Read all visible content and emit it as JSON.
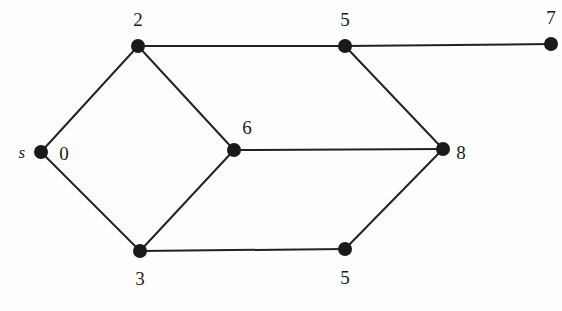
{
  "figure": {
    "type": "undirected-graph-diagram",
    "background_color": "#fefefe",
    "ink_color": "#1a1a1a",
    "edge_color": "#222222",
    "width": 562,
    "height": 311
  },
  "graph_data": {
    "type": "node-link-diagram",
    "directed": false,
    "node_radius": 7,
    "edge_width": 2,
    "nodes": [
      {
        "id": "s",
        "label": "s",
        "label_style": "italic",
        "x": 41,
        "y": 152,
        "label_x": 22,
        "label_y": 152,
        "extra_label": "0",
        "extra_label_x": 64,
        "extra_label_y": 153
      },
      {
        "id": "n2",
        "label": "2",
        "label_style": "normal",
        "x": 138,
        "y": 46,
        "label_x": 138,
        "label_y": 19
      },
      {
        "id": "n3",
        "label": "3",
        "label_style": "normal",
        "x": 140,
        "y": 251,
        "label_x": 140,
        "label_y": 278
      },
      {
        "id": "n6",
        "label": "6",
        "label_style": "normal",
        "x": 234,
        "y": 150,
        "label_x": 247,
        "label_y": 127
      },
      {
        "id": "n5t",
        "label": "5",
        "label_style": "normal",
        "x": 345,
        "y": 46,
        "label_x": 345,
        "label_y": 19
      },
      {
        "id": "n5b",
        "label": "5",
        "label_style": "normal",
        "x": 345,
        "y": 249,
        "label_x": 345,
        "label_y": 277
      },
      {
        "id": "n8",
        "label": "8",
        "label_style": "normal",
        "x": 443,
        "y": 149,
        "label_x": 461,
        "label_y": 152
      },
      {
        "id": "n7",
        "label": "7",
        "label_style": "normal",
        "x": 551,
        "y": 44,
        "label_x": 551,
        "label_y": 17
      }
    ],
    "edges": [
      {
        "from": "s",
        "to": "n2"
      },
      {
        "from": "s",
        "to": "n3"
      },
      {
        "from": "n2",
        "to": "n6"
      },
      {
        "from": "n3",
        "to": "n6"
      },
      {
        "from": "n2",
        "to": "n5t"
      },
      {
        "from": "n5t",
        "to": "n7"
      },
      {
        "from": "n5t",
        "to": "n8"
      },
      {
        "from": "n6",
        "to": "n8"
      },
      {
        "from": "n3",
        "to": "n5b"
      },
      {
        "from": "n5b",
        "to": "n8"
      }
    ]
  }
}
